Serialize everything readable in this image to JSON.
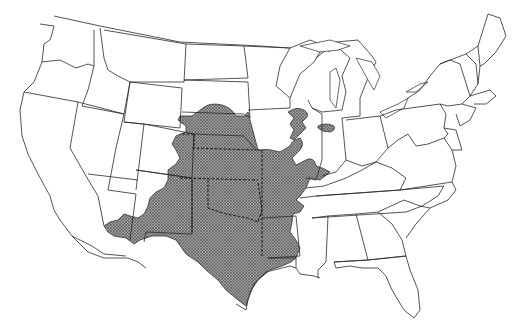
{
  "map": {
    "title": "",
    "region": "Contiguous United States",
    "legend": [],
    "shaded_area": {
      "description": "Shaded distribution range covering central/south-central US",
      "fill_color": "#8a8a8a",
      "pattern": "cross-hatch",
      "states_covered": [
        "Texas",
        "Oklahoma",
        "Kansas",
        "Nebraska",
        "New Mexico (east)",
        "Colorado (east)",
        "Missouri",
        "Arkansas (west)",
        "Arizona (southeast)",
        "Iowa (southwest)",
        "South Dakota (south)",
        "Louisiana (northwest)",
        "Illinois (patches)",
        "Wisconsin (patch)",
        "Indiana (patch)"
      ]
    },
    "outline_color": "#2a2a2a",
    "background": "#ffffff"
  }
}
